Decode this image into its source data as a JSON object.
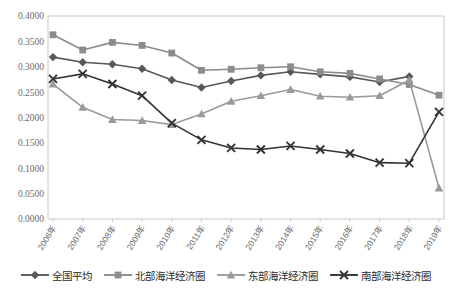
{
  "chart_data": {
    "type": "line",
    "title": "",
    "xlabel": "",
    "ylabel": "",
    "grid": false,
    "legend_position": "bottom",
    "categories": [
      "2006年",
      "2007年",
      "2008年",
      "2009年",
      "2010年",
      "2011年",
      "2012年",
      "2013年",
      "2014年",
      "2015年",
      "2016年",
      "2017年",
      "2018年",
      "2019年"
    ],
    "ylim": [
      0.0,
      0.4
    ],
    "ytick_labels": [
      "0.4000",
      "0.3500",
      "0.3000",
      "0.2500",
      "0.2000",
      "0.1500",
      "0.1000",
      "0.0500",
      "0.0000"
    ],
    "ytick_values": [
      0.4,
      0.35,
      0.3,
      0.25,
      0.2,
      0.15,
      0.1,
      0.05,
      0.0
    ],
    "series": [
      {
        "name": "全国平均",
        "marker": "diamond",
        "color": "#585858",
        "values": [
          0.319,
          0.309,
          0.305,
          0.296,
          0.274,
          0.259,
          0.272,
          0.283,
          0.29,
          0.285,
          0.28,
          0.27,
          0.281,
          null
        ]
      },
      {
        "name": "北部海洋经济圈",
        "marker": "square",
        "color": "#8c8c8c",
        "values": [
          0.363,
          0.333,
          0.348,
          0.342,
          0.327,
          0.293,
          0.295,
          0.298,
          0.3,
          0.29,
          0.287,
          0.276,
          0.265,
          0.244
        ]
      },
      {
        "name": "东部海洋经济圈",
        "marker": "triangle",
        "color": "#9a9a9a",
        "values": [
          0.266,
          0.22,
          0.196,
          0.194,
          0.186,
          0.207,
          0.232,
          0.243,
          0.255,
          0.242,
          0.24,
          0.243,
          0.274,
          0.061
        ]
      },
      {
        "name": "南部海洋经济圈",
        "marker": "cross",
        "color": "#333333",
        "values": [
          0.276,
          0.286,
          0.266,
          0.243,
          0.189,
          0.156,
          0.14,
          0.137,
          0.144,
          0.137,
          0.129,
          0.111,
          0.11,
          0.211
        ]
      }
    ]
  }
}
